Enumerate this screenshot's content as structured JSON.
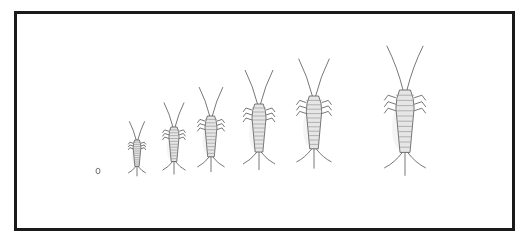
{
  "illustration": {
    "subject": "silverfish life stages",
    "stages": [
      {
        "label": "egg",
        "cx": 98,
        "cy": 171,
        "scale": 0
      },
      {
        "label": "stage-1",
        "cx": 137,
        "top": 140,
        "scale": 0.55
      },
      {
        "label": "stage-2",
        "cx": 174,
        "top": 127,
        "scale": 0.72
      },
      {
        "label": "stage-3",
        "cx": 211,
        "top": 116,
        "scale": 0.85
      },
      {
        "label": "stage-4",
        "cx": 259,
        "top": 104,
        "scale": 1.0
      },
      {
        "label": "stage-5",
        "cx": 314,
        "top": 96,
        "scale": 1.1
      },
      {
        "label": "stage-6",
        "cx": 405,
        "top": 90,
        "scale": 1.3
      }
    ],
    "colors": {
      "border": "#1a1a1a",
      "ink": "#555555",
      "shade": "#9a9a9a"
    }
  }
}
